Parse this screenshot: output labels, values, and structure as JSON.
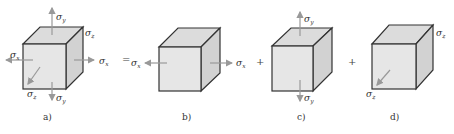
{
  "figure": {
    "panels": [
      {
        "id": "a",
        "caption": "a)",
        "stresses": [
          "σx",
          "σy",
          "σz"
        ]
      },
      {
        "id": "b",
        "caption": "b)",
        "stresses": [
          "σx"
        ]
      },
      {
        "id": "c",
        "caption": "c)",
        "stresses": [
          "σy"
        ]
      },
      {
        "id": "d",
        "caption": "d)",
        "stresses": [
          "σz"
        ]
      }
    ],
    "operators": [
      "=",
      "+",
      "+"
    ],
    "labels": {
      "sigma": "σ",
      "x": "x",
      "y": "y",
      "z": "z"
    },
    "colors": {
      "edge": "#333333",
      "front_face": "#e6e6e6",
      "arrow": "#999999"
    }
  }
}
